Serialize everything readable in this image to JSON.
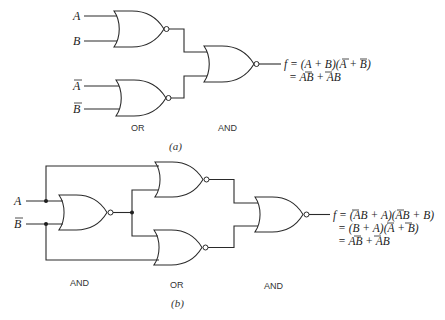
{
  "figure": {
    "part_a": {
      "caption": "(a)",
      "inputs": [
        {
          "name": "A",
          "complement": false
        },
        {
          "name": "B",
          "complement": false
        },
        {
          "name": "A",
          "complement": true
        },
        {
          "name": "B",
          "complement": true
        }
      ],
      "gates": [
        {
          "id": "a1",
          "type": "NOR",
          "inputs": [
            "A",
            "B"
          ]
        },
        {
          "id": "a2",
          "type": "NOR",
          "inputs": [
            "A-bar",
            "B-bar"
          ]
        },
        {
          "id": "a3",
          "type": "NOR",
          "inputs": [
            "a1",
            "a2"
          ]
        }
      ],
      "stage_labels": [
        "OR",
        "AND"
      ],
      "output": {
        "lines": [
          "f = (A + B)(Ā + B̄)",
          "= AB̄ + ĀB"
        ]
      }
    },
    "part_b": {
      "caption": "(b)",
      "inputs": [
        {
          "name": "A",
          "complement": false
        },
        {
          "name": "B",
          "complement": true
        }
      ],
      "gates": [
        {
          "id": "b1",
          "type": "NOR",
          "inputs": [
            "A",
            "B-bar"
          ]
        },
        {
          "id": "b2",
          "type": "NOR",
          "inputs": [
            "A",
            "b1"
          ]
        },
        {
          "id": "b3",
          "type": "NOR",
          "inputs": [
            "b1",
            "B-bar"
          ]
        },
        {
          "id": "b4",
          "type": "NOR",
          "inputs": [
            "b2",
            "b3"
          ]
        }
      ],
      "stage_labels": [
        "AND",
        "OR",
        "AND"
      ],
      "output": {
        "lines": [
          "f = (ĀB + A)(ĀB + B)",
          "= (B + A)(Ā + B̄)",
          "= AB̄ + ĀB"
        ]
      }
    }
  }
}
